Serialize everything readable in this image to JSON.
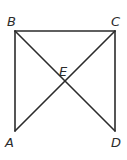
{
  "figure": {
    "type": "geometry",
    "points": {
      "A": {
        "label": "A",
        "x": 15,
        "y": 131,
        "lx": 5,
        "ly": 147
      },
      "B": {
        "label": "B",
        "x": 15,
        "y": 31,
        "lx": 7,
        "ly": 26
      },
      "C": {
        "label": "C",
        "x": 115,
        "y": 31,
        "lx": 111,
        "ly": 26
      },
      "D": {
        "label": "D",
        "x": 115,
        "y": 131,
        "lx": 111,
        "ly": 147
      },
      "E": {
        "label": "E",
        "x": 65,
        "y": 81,
        "lx": 59,
        "ly": 76
      }
    },
    "segments": [
      {
        "name": "side-ab",
        "from": "A",
        "to": "B"
      },
      {
        "name": "side-bc",
        "from": "B",
        "to": "C"
      },
      {
        "name": "side-cd",
        "from": "C",
        "to": "D"
      },
      {
        "name": "diagonal-bd",
        "from": "B",
        "to": "D"
      },
      {
        "name": "diagonal-ac",
        "from": "A",
        "to": "C"
      }
    ],
    "colors": {
      "stroke": "#2b2b2b",
      "background": "#ffffff"
    }
  }
}
